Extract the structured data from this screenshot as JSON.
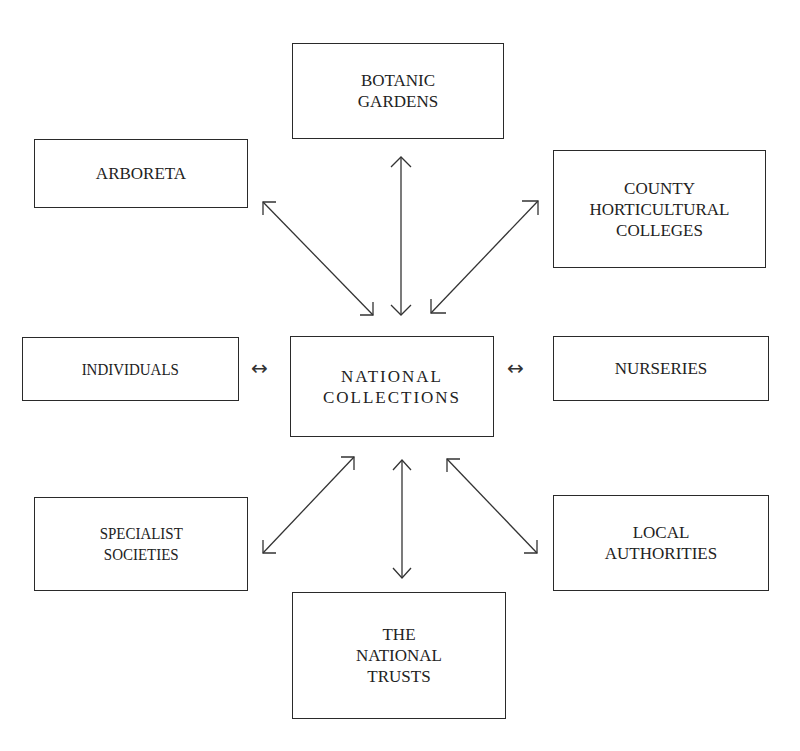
{
  "diagram": {
    "center": {
      "label": "NATIONAL\nCOLLECTIONS"
    },
    "nodes": [
      {
        "id": "botanic-gardens",
        "label": "BOTANIC\nGARDENS"
      },
      {
        "id": "arboreta",
        "label": "ARBORETA"
      },
      {
        "id": "county-horticultural-colleges",
        "label": "COUNTY\nHORTICULTURAL\nCOLLEGES"
      },
      {
        "id": "individuals",
        "label": "INDIVIDUALS"
      },
      {
        "id": "nurseries",
        "label": "NURSERIES"
      },
      {
        "id": "specialist-societies",
        "label": "SPECIALIST\nSOCIETIES"
      },
      {
        "id": "local-authorities",
        "label": "LOCAL\nAUTHORITIES"
      },
      {
        "id": "the-national-trusts",
        "label": "THE\nNATIONAL\nTRUSTS"
      }
    ],
    "edges": [
      {
        "from": "national-collections",
        "to": "botanic-gardens",
        "direction": "bidirectional"
      },
      {
        "from": "national-collections",
        "to": "arboreta",
        "direction": "bidirectional"
      },
      {
        "from": "national-collections",
        "to": "county-horticultural-colleges",
        "direction": "bidirectional"
      },
      {
        "from": "national-collections",
        "to": "individuals",
        "direction": "bidirectional",
        "glyph": "↔"
      },
      {
        "from": "national-collections",
        "to": "nurseries",
        "direction": "bidirectional",
        "glyph": "↔"
      },
      {
        "from": "national-collections",
        "to": "specialist-societies",
        "direction": "bidirectional"
      },
      {
        "from": "national-collections",
        "to": "local-authorities",
        "direction": "bidirectional"
      },
      {
        "from": "national-collections",
        "to": "the-national-trusts",
        "direction": "bidirectional"
      }
    ],
    "colors": {
      "ink": "#2a2a2a",
      "background": "#ffffff"
    }
  }
}
